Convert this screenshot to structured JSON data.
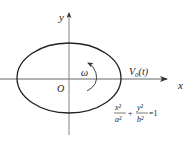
{
  "diagram": {
    "title": "",
    "colors": {
      "ink": "#222222",
      "axis": "#555555",
      "background": "#ffffff"
    },
    "axes": {
      "x_label": "x",
      "y_label": "y",
      "origin_label": "O"
    },
    "ellipse": {
      "cx": 69,
      "cy": 78,
      "rx": 52,
      "ry": 35
    },
    "rotation": {
      "label": "ω",
      "direction": "counterclockwise"
    },
    "velocity": {
      "label_main": "V",
      "label_sub": "0",
      "label_arg": "(t)"
    },
    "equation": {
      "term1_num": "x²",
      "term1_den": "a²",
      "plus": "+",
      "term2_num": "y²",
      "term2_den": "b²",
      "rhs": "=1"
    }
  }
}
